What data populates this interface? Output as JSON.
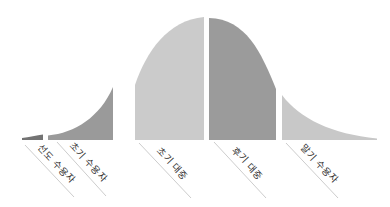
{
  "diagram": {
    "name": "technology-adoption-lifecycle-bell-curve",
    "segments": [
      {
        "label": "선도 수용자",
        "color": "#737373"
      },
      {
        "label": "초기 수용자",
        "color": "#9a9a9a"
      },
      {
        "label": "초기 대중",
        "color": "#cbcbcb"
      },
      {
        "label": "후기 대중",
        "color": "#9b9b9b"
      },
      {
        "label": "말기 수용자",
        "color": "#c8c8c8"
      }
    ],
    "styles": {
      "background": "#ffffff",
      "leader_line": "#c6c6c6",
      "label_text": "#333333"
    }
  }
}
